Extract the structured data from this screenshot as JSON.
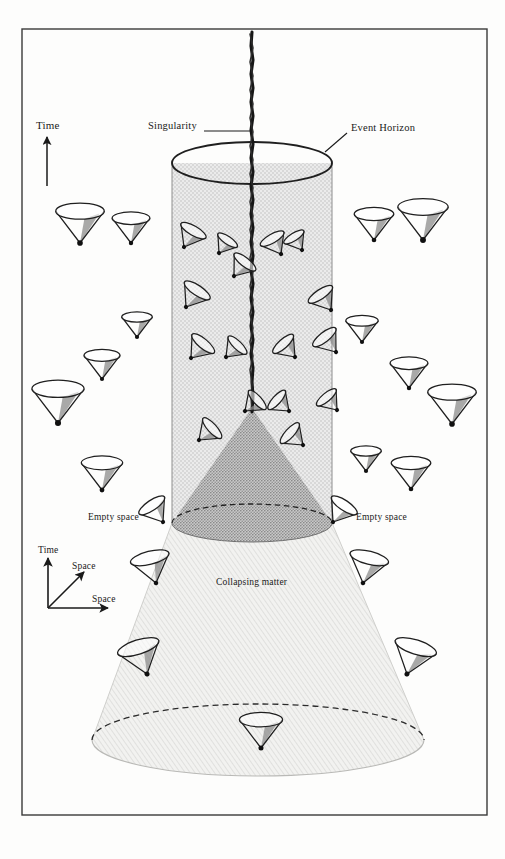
{
  "figure": {
    "frame": {
      "x": 22,
      "y": 29,
      "width": 465,
      "height": 786,
      "stroke": "#3a3a3a"
    },
    "colors": {
      "ink": "#1a1a1a",
      "horizon_fill": "#e3e3e3",
      "inner_cone_fill": "#9a9a9a",
      "matter_fill": "#ececec",
      "singularity": "#161616",
      "page_background": "#fdfdfc"
    }
  },
  "labels": {
    "singularity": "Singularity",
    "event_horizon": "Event Horizon",
    "time_main": "Time",
    "empty_space_left": "Empty space",
    "empty_space_right": "Empty space",
    "collapsing_matter": "Collapsing matter",
    "axis_time": "Time",
    "axis_space_diagonal": "Space",
    "axis_space_horizontal": "Space"
  },
  "geometry": {
    "singularity_line": {
      "x": 252,
      "y_top": 32,
      "y_bottom": 420
    },
    "horizon_cylinder": {
      "top_ellipse": {
        "cx": 252,
        "cy": 163,
        "rx": 80,
        "ry": 21
      },
      "left_x": 172,
      "right_x": 332,
      "y_bottom": 523
    },
    "inner_cone": {
      "apex": {
        "x": 252,
        "y": 410
      },
      "base_ellipse": {
        "cx": 252,
        "cy": 523,
        "rx": 80,
        "ry": 19
      }
    },
    "matter_region": {
      "top_left_x": 172,
      "top_right_x": 332,
      "top_y": 523,
      "bottom_left_x": 92,
      "bottom_right_x": 425,
      "bottom_ellipse": {
        "cx": 258,
        "cy": 740,
        "rx": 166,
        "ry": 36
      }
    },
    "axis_legend": {
      "origin": {
        "x": 48,
        "y": 608
      },
      "time_arrow_to": {
        "x": 48,
        "y": 556
      },
      "diagonal_arrow_to": {
        "x": 86,
        "y": 570
      },
      "horizontal_arrow_to": {
        "x": 112,
        "y": 608
      }
    },
    "time_arrow_main": {
      "x": 47,
      "y_bottom": 185,
      "y_top": 134
    }
  },
  "light_cones": {
    "description": "Future light cones: inverted cone, apex dot at the event, ellipse mouth opening upward. Tilt increases toward the singularity.",
    "outside": [
      {
        "x": 80,
        "y": 243,
        "size": 27,
        "tilt": 0
      },
      {
        "x": 131,
        "y": 243,
        "size": 21,
        "tilt": 0
      },
      {
        "x": 102,
        "y": 379,
        "size": 20,
        "tilt": 0
      },
      {
        "x": 58,
        "y": 423,
        "size": 29,
        "tilt": 0
      },
      {
        "x": 102,
        "y": 490,
        "size": 23,
        "tilt": 0
      },
      {
        "x": 137,
        "y": 337,
        "size": 17,
        "tilt": 0
      },
      {
        "x": 374,
        "y": 240,
        "size": 22,
        "tilt": 0
      },
      {
        "x": 423,
        "y": 240,
        "size": 28,
        "tilt": 0
      },
      {
        "x": 362,
        "y": 342,
        "size": 18,
        "tilt": 0
      },
      {
        "x": 409,
        "y": 388,
        "size": 21,
        "tilt": 0
      },
      {
        "x": 452,
        "y": 424,
        "size": 27,
        "tilt": 0
      },
      {
        "x": 366,
        "y": 471,
        "size": 17,
        "tilt": 0
      },
      {
        "x": 411,
        "y": 489,
        "size": 22,
        "tilt": 0
      },
      {
        "x": 147,
        "y": 674,
        "size": 24,
        "tilt": -18
      },
      {
        "x": 407,
        "y": 674,
        "size": 24,
        "tilt": 18
      },
      {
        "x": 261,
        "y": 748,
        "size": 24,
        "tilt": 0
      },
      {
        "x": 156,
        "y": 583,
        "size": 22,
        "tilt": -14
      },
      {
        "x": 363,
        "y": 583,
        "size": 22,
        "tilt": 14
      },
      {
        "x": 163,
        "y": 522,
        "size": 17,
        "tilt": -34
      },
      {
        "x": 333,
        "y": 522,
        "size": 17,
        "tilt": 34
      }
    ],
    "inside": [
      {
        "x": 184,
        "y": 247,
        "size": 16,
        "tilt": 30
      },
      {
        "x": 219,
        "y": 253,
        "size": 13,
        "tilt": 34
      },
      {
        "x": 234,
        "y": 276,
        "size": 15,
        "tilt": 38
      },
      {
        "x": 281,
        "y": 254,
        "size": 15,
        "tilt": -30
      },
      {
        "x": 302,
        "y": 250,
        "size": 13,
        "tilt": -32
      },
      {
        "x": 186,
        "y": 307,
        "size": 17,
        "tilt": 34
      },
      {
        "x": 331,
        "y": 310,
        "size": 16,
        "tilt": -34
      },
      {
        "x": 191,
        "y": 358,
        "size": 16,
        "tilt": 40
      },
      {
        "x": 226,
        "y": 357,
        "size": 14,
        "tilt": 44
      },
      {
        "x": 295,
        "y": 357,
        "size": 15,
        "tilt": -42
      },
      {
        "x": 336,
        "y": 352,
        "size": 16,
        "tilt": -38
      },
      {
        "x": 245,
        "y": 411,
        "size": 14,
        "tilt": 48
      },
      {
        "x": 289,
        "y": 411,
        "size": 14,
        "tilt": -48
      },
      {
        "x": 199,
        "y": 440,
        "size": 15,
        "tilt": 48
      },
      {
        "x": 303,
        "y": 445,
        "size": 15,
        "tilt": -48
      },
      {
        "x": 337,
        "y": 410,
        "size": 14,
        "tilt": -40
      }
    ]
  }
}
